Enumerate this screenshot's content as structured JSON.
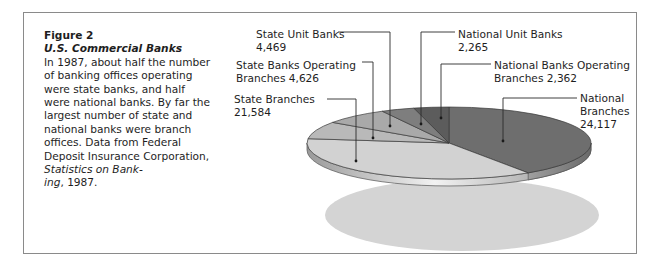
{
  "caption": {
    "figure": "Figure 2",
    "title": "U.S. Commercial Banks",
    "body_1": "In 1987, about half the number of banking offices operating were state banks, and half were national banks. By far the largest number of state and national banks were branch offices. Data from Federal Deposit Insurance Corporation, ",
    "source_italic_1": "Statistics on Bank-",
    "source_italic_2": "ing",
    "body_2": ", 1987."
  },
  "labels": {
    "state_unit": {
      "line1": "State Unit Banks",
      "line2": "4,469"
    },
    "state_operating": {
      "line1": "State Banks Operating",
      "line2": "Branches 4,626"
    },
    "state_branches": {
      "line1": "State Branches",
      "line2": "21,584"
    },
    "national_unit": {
      "line1": "National Unit Banks",
      "line2": "2,265"
    },
    "national_operating": {
      "line1": "National Banks Operating",
      "line2": "Branches 2,362"
    },
    "national_branches": {
      "line1": "National",
      "line2": "Branches",
      "line3": "24,117"
    }
  },
  "chart_data": {
    "type": "pie",
    "title": "U.S. Commercial Banks",
    "subtitle": "Figure 2",
    "year": 1987,
    "style": "3d-tilted",
    "categories": [
      "National Branches",
      "State Branches",
      "State Banks Operating Branches",
      "State Unit Banks",
      "National Unit Banks",
      "National Banks Operating Branches"
    ],
    "values": [
      24117,
      21584,
      4626,
      4469,
      2265,
      2362
    ],
    "colors": [
      "#6e6e6e",
      "#d2d2d2",
      "#b9b9b9",
      "#a9a9a9",
      "#7e7e7e",
      "#5c5c5c"
    ],
    "legend": "callout labels with leader lines",
    "source": "Federal Deposit Insurance Corporation, Statistics on Banking, 1987"
  }
}
